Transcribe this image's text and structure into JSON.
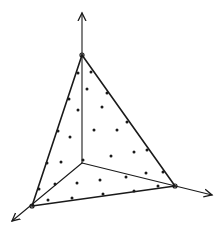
{
  "diagram": {
    "stroke_color": "#1a1a1a",
    "dot_color": "#1a1a1a",
    "background": "#ffffff",
    "origin": [
      82,
      163
    ],
    "axes": {
      "z": {
        "from": [
          82,
          163
        ],
        "to": [
          82,
          13
        ]
      },
      "x": {
        "from": [
          82,
          163
        ],
        "to": [
          12,
          221
        ]
      },
      "y": {
        "from": [
          82,
          163
        ],
        "to": [
          212,
          195
        ]
      }
    },
    "vertices": {
      "top": [
        82,
        55
      ],
      "left": [
        32,
        206
      ],
      "right": [
        175,
        186
      ]
    },
    "dots": [
      [
        78,
        73
      ],
      [
        69,
        99
      ],
      [
        78,
        110
      ],
      [
        58,
        131
      ],
      [
        70,
        137
      ],
      [
        47,
        163
      ],
      [
        61,
        162
      ],
      [
        39,
        189
      ],
      [
        55,
        184
      ],
      [
        48,
        200
      ],
      [
        91,
        72
      ],
      [
        87,
        89
      ],
      [
        107,
        93
      ],
      [
        102,
        107
      ],
      [
        127,
        122
      ],
      [
        94,
        130
      ],
      [
        117,
        130
      ],
      [
        147,
        150
      ],
      [
        134,
        152
      ],
      [
        111,
        156
      ],
      [
        83,
        160
      ],
      [
        146,
        173
      ],
      [
        163,
        172
      ],
      [
        77,
        183
      ],
      [
        100,
        180
      ],
      [
        126,
        177
      ],
      [
        158,
        186
      ],
      [
        72,
        198
      ],
      [
        103,
        194
      ],
      [
        134,
        191
      ]
    ]
  }
}
